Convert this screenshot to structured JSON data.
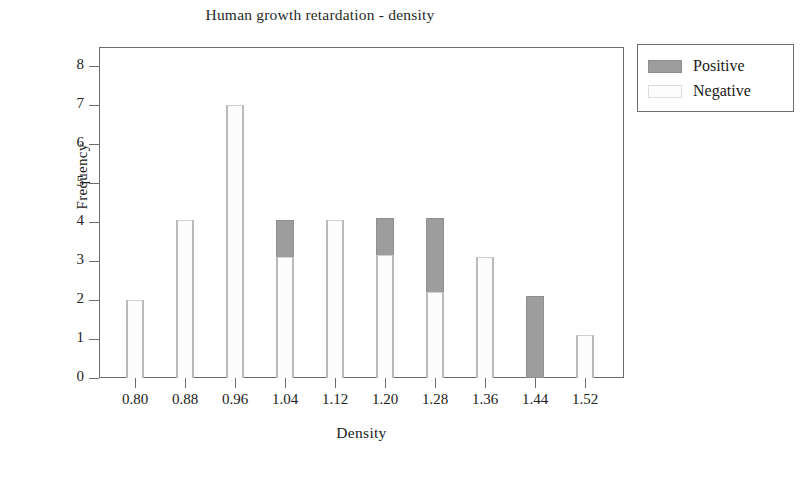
{
  "chart_data": {
    "type": "bar",
    "title": "Human growth retardation - density",
    "xlabel": "Density",
    "ylabel": "Frequency",
    "stacked": true,
    "grid": false,
    "legend_position": "right-top",
    "ylim": [
      0,
      8.5
    ],
    "ytick_labels": [
      "8",
      "7",
      "6",
      "5",
      "4",
      "3",
      "2",
      "1",
      "0"
    ],
    "yticks": [
      8,
      7,
      6,
      5,
      4,
      3,
      2,
      1,
      0
    ],
    "categories": [
      "0.80",
      "0.88",
      "0.96",
      "1.04",
      "1.12",
      "1.20",
      "1.28",
      "1.36",
      "1.44",
      "1.52"
    ],
    "series": [
      {
        "name": "Positive",
        "color": "#9d9d9d",
        "values": [
          1.1,
          2.05,
          1.1,
          4.05,
          1.1,
          4.1,
          4.1,
          1.1,
          2.1,
          1.1
        ]
      },
      {
        "name": "Negative",
        "color": "#fcfcfc",
        "values": [
          2.0,
          4.05,
          7.0,
          3.1,
          4.05,
          3.15,
          2.2,
          3.1,
          0.0,
          1.1
        ]
      }
    ]
  },
  "legend": {
    "entries": [
      {
        "label": "Positive",
        "swatch": "positive"
      },
      {
        "label": "Negative",
        "swatch": "negative"
      }
    ]
  }
}
